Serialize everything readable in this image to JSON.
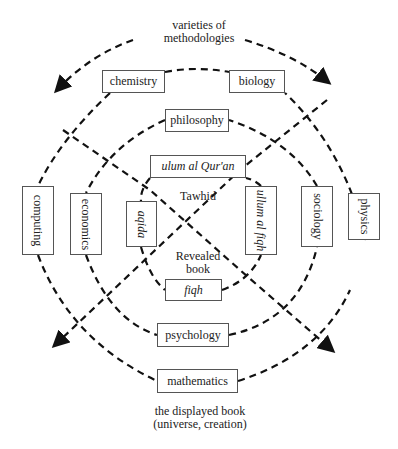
{
  "title_top": [
    "varieties of",
    "methodologies"
  ],
  "title_bottom": [
    "the displayed book",
    "(universe, creation)"
  ],
  "center_labels": {
    "top": "Tawhid",
    "bottom": [
      "Revealed",
      "book"
    ]
  },
  "boxes": {
    "chemistry": "chemistry",
    "biology": "biology",
    "philosophy": "philosophy",
    "ulum_quran": "ulum al Qur'an",
    "computing": "computing",
    "economics": "economics",
    "aqida": "aqida",
    "ulum_fiqh": "ullum al fiqh",
    "sociology": "sociology",
    "physics": "physics",
    "fiqh": "fiqh",
    "psychology": "psychology",
    "mathematics": "mathematics"
  }
}
